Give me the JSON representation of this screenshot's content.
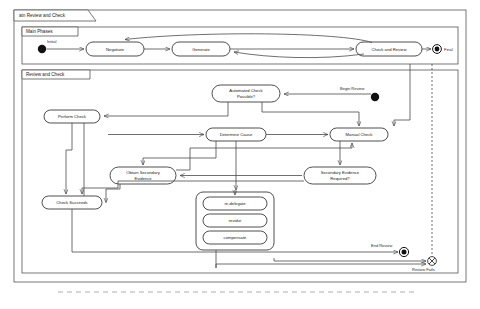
{
  "diagram": {
    "type": "uml-activity-diagram",
    "frame_label": "atn Review and Check",
    "frames": [
      {
        "id": "main-phases",
        "label": "Main Phases"
      },
      {
        "id": "review-and-check",
        "label": "Review and Check"
      }
    ]
  },
  "main_phases": {
    "label": "Main Phases",
    "initial_label": "Initial",
    "final_label": "Final",
    "nodes": [
      {
        "id": "negotiate",
        "label": "Negotiate"
      },
      {
        "id": "generate",
        "label": "Generate"
      },
      {
        "id": "check-and-review",
        "label": "Check and Review"
      }
    ]
  },
  "review_and_check": {
    "label": "Review and Check",
    "begin_review_label": "Begin Review",
    "end_review_label": "End Review",
    "review_fails_label": "Review Fails",
    "nodes": [
      {
        "id": "automated-check-possible",
        "label_line1": "Automated Check",
        "label_line2": "Possible?"
      },
      {
        "id": "perform-check",
        "label": "Perform Check"
      },
      {
        "id": "determine-cause",
        "label": "Determine Cause"
      },
      {
        "id": "manual-check",
        "label": "Manual Check"
      },
      {
        "id": "obtain-secondary-evidence",
        "label_line1": "Obtain Secondary",
        "label_line2": "Evidence"
      },
      {
        "id": "secondary-evidence-required",
        "label_line1": "Secondary Evidence",
        "label_line2": "Required?"
      },
      {
        "id": "check-succeeds",
        "label": "Check Succeeds"
      }
    ],
    "remediation_group": {
      "options": [
        {
          "id": "re-delegate",
          "label": "re-delegate"
        },
        {
          "id": "revoke",
          "label": "revoke"
        },
        {
          "id": "compensate",
          "label": "compensate"
        }
      ]
    }
  },
  "colors": {
    "background": "#ffffff",
    "frame_stroke": "#555555",
    "node_stroke": "#3a3a3a",
    "edge_stroke": "#4a4a4a",
    "text": "#1a1a1a",
    "initial_fill": "#111111"
  }
}
